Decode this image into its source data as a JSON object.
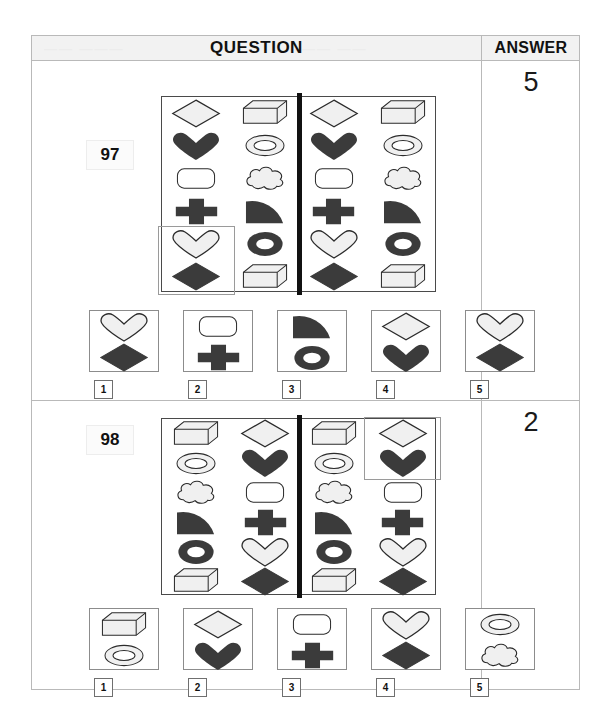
{
  "header": {
    "question_label": "QUESTION",
    "answer_label": "ANSWER",
    "watermark_left": "—— ———",
    "watermark_right": "——— ——"
  },
  "questions": [
    {
      "number": "97",
      "answer": "5",
      "matrix": {
        "rows": 6,
        "panels": [
          {
            "name": "left-panel",
            "columns": [
              [
                "diamond-outline",
                "heart-filled",
                "rounded-rect-outline",
                "cross-filled",
                "heart-outline",
                "diamond-filled"
              ],
              [
                "box-3d",
                "ellipse-ring-outline",
                "cloud-outline",
                "quarter-pie-filled",
                "ring-thick-filled",
                "box-3d"
              ]
            ]
          },
          {
            "name": "right-panel",
            "columns": [
              [
                "diamond-outline",
                "heart-filled",
                "rounded-rect-outline",
                "cross-filled",
                "heart-outline",
                "diamond-filled"
              ],
              [
                "box-3d",
                "ellipse-ring-outline",
                "cloud-outline",
                "quarter-pie-filled",
                "ring-thick-filled",
                "box-3d"
              ]
            ]
          }
        ],
        "highlight": {
          "panel": "left-panel",
          "column": 0,
          "row_start": 4,
          "row_end": 5
        }
      },
      "options": [
        {
          "label": "1",
          "shapes": [
            "heart-outline",
            "diamond-filled"
          ]
        },
        {
          "label": "2",
          "shapes": [
            "rounded-rect-outline",
            "cross-filled"
          ]
        },
        {
          "label": "3",
          "shapes": [
            "quarter-pie-filled",
            "ring-thick-filled"
          ]
        },
        {
          "label": "4",
          "shapes": [
            "diamond-outline",
            "heart-filled"
          ]
        },
        {
          "label": "5",
          "shapes": [
            "heart-outline",
            "diamond-filled"
          ]
        }
      ]
    },
    {
      "number": "98",
      "answer": "2",
      "matrix": {
        "rows": 6,
        "panels": [
          {
            "name": "left-panel",
            "columns": [
              [
                "box-3d",
                "ellipse-ring-outline",
                "cloud-outline",
                "quarter-pie-filled",
                "ring-thick-filled",
                "box-3d"
              ],
              [
                "diamond-outline",
                "heart-filled",
                "rounded-rect-outline",
                "cross-filled",
                "heart-outline",
                "diamond-filled"
              ]
            ]
          },
          {
            "name": "right-panel",
            "columns": [
              [
                "box-3d",
                "ellipse-ring-outline",
                "cloud-outline",
                "quarter-pie-filled",
                "ring-thick-filled",
                "box-3d"
              ],
              [
                "diamond-outline",
                "heart-filled",
                "rounded-rect-outline",
                "cross-filled",
                "heart-outline",
                "diamond-filled"
              ]
            ]
          }
        ],
        "highlight": {
          "panel": "right-panel",
          "column": 1,
          "row_start": 0,
          "row_end": 1
        }
      },
      "options": [
        {
          "label": "1",
          "shapes": [
            "box-3d",
            "ellipse-ring-outline"
          ]
        },
        {
          "label": "2",
          "shapes": [
            "diamond-outline",
            "heart-filled"
          ]
        },
        {
          "label": "3",
          "shapes": [
            "rounded-rect-outline",
            "cross-filled"
          ]
        },
        {
          "label": "4",
          "shapes": [
            "heart-outline",
            "diamond-filled"
          ]
        },
        {
          "label": "5",
          "shapes": [
            "ellipse-ring-outline",
            "cloud-outline"
          ]
        }
      ]
    }
  ],
  "colors": {
    "fill_dark": "#3b3b3b",
    "fill_light": "#f0f0f0",
    "stroke": "#2b2b2b",
    "frame": "#b9b9b9",
    "divider": "#111111"
  }
}
